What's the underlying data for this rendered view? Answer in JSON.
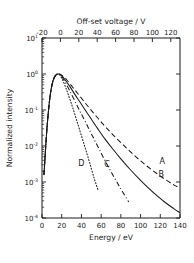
{
  "chart_data": {
    "type": "line",
    "title": "",
    "xlabel": "Energy / eV",
    "ylabel": "Normalized intensity",
    "secondary_xlabel": "Off-set voltage / V",
    "xlim": [
      0,
      140
    ],
    "ylim": [
      0.0001,
      10
    ],
    "yscale": "log",
    "secondary_xlim": [
      -20,
      130
    ],
    "grid": false,
    "legend": "inline-curve-labels",
    "x_ticks": [
      0,
      20,
      40,
      60,
      80,
      100,
      120,
      140
    ],
    "x_ticklabels": [
      "0",
      "20",
      "40",
      "60",
      "80",
      "100",
      "120",
      "140"
    ],
    "secondary_x_ticks": [
      -20,
      0,
      20,
      40,
      60,
      80,
      100,
      120
    ],
    "secondary_x_ticklabels": [
      "-20",
      "0",
      "20",
      "40",
      "60",
      "80",
      "100",
      "120"
    ],
    "y_ticks": [
      10,
      1,
      0.1,
      0.01,
      0.001,
      0.0001
    ],
    "y_ticklabels": [
      {
        "mantissa": "10",
        "exponent": "1"
      },
      {
        "mantissa": "10",
        "exponent": "0"
      },
      {
        "mantissa": "10",
        "exponent": "-1"
      },
      {
        "mantissa": "10",
        "exponent": "-2"
      },
      {
        "mantissa": "10",
        "exponent": "-3"
      },
      {
        "mantissa": "10",
        "exponent": "-4"
      }
    ],
    "series": [
      {
        "name": "A",
        "label": "A",
        "linestyle": "dashed",
        "color": "#1a1a1a",
        "label_x": 122,
        "label_y": 0.0032,
        "x": [
          2,
          5,
          8,
          11,
          14,
          17,
          20,
          24,
          28,
          33,
          38,
          44,
          50,
          57,
          64,
          72,
          80,
          89,
          98,
          107,
          116,
          125,
          134,
          140
        ],
        "y": [
          0.0016,
          0.03,
          0.22,
          0.62,
          0.93,
          1.0,
          0.93,
          0.74,
          0.55,
          0.37,
          0.25,
          0.155,
          0.098,
          0.058,
          0.035,
          0.0205,
          0.0125,
          0.0072,
          0.0043,
          0.0027,
          0.00175,
          0.00118,
          0.00082,
          0.00068
        ]
      },
      {
        "name": "B",
        "label": "B",
        "linestyle": "solid",
        "color": "#1a1a1a",
        "label_x": 121,
        "label_y": 0.00135,
        "x": [
          2,
          5,
          8,
          11,
          14,
          17,
          20,
          24,
          28,
          33,
          38,
          44,
          50,
          57,
          64,
          72,
          80,
          89,
          98,
          107,
          116,
          125,
          134,
          140
        ],
        "y": [
          0.0016,
          0.03,
          0.22,
          0.62,
          0.93,
          1.0,
          0.9,
          0.66,
          0.46,
          0.28,
          0.175,
          0.098,
          0.056,
          0.029,
          0.0155,
          0.0081,
          0.0044,
          0.0023,
          0.00126,
          0.00072,
          0.00043,
          0.00027,
          0.00018,
          0.00014
        ]
      },
      {
        "name": "C",
        "label": "C",
        "linestyle": "dashdot",
        "color": "#1a1a1a",
        "label_x": 66,
        "label_y": 0.0026,
        "x": [
          2,
          5,
          8,
          11,
          14,
          17,
          20,
          24,
          28,
          33,
          38,
          44,
          50,
          57,
          64,
          72,
          80,
          88
        ],
        "y": [
          0.0016,
          0.03,
          0.22,
          0.62,
          0.93,
          1.0,
          0.86,
          0.56,
          0.35,
          0.185,
          0.098,
          0.047,
          0.022,
          0.0092,
          0.0039,
          0.00155,
          0.00064,
          0.00028
        ]
      },
      {
        "name": "D",
        "label": "D",
        "linestyle": "dotted",
        "color": "#1a1a1a",
        "label_x": 40,
        "label_y": 0.0027,
        "x": [
          2,
          5,
          8,
          11,
          14,
          17,
          20,
          23,
          26,
          30,
          34,
          38,
          43,
          48,
          53,
          57
        ],
        "y": [
          0.0016,
          0.03,
          0.22,
          0.62,
          0.93,
          0.99,
          0.77,
          0.5,
          0.3,
          0.145,
          0.066,
          0.029,
          0.0105,
          0.0037,
          0.00125,
          0.00058
        ]
      }
    ]
  }
}
